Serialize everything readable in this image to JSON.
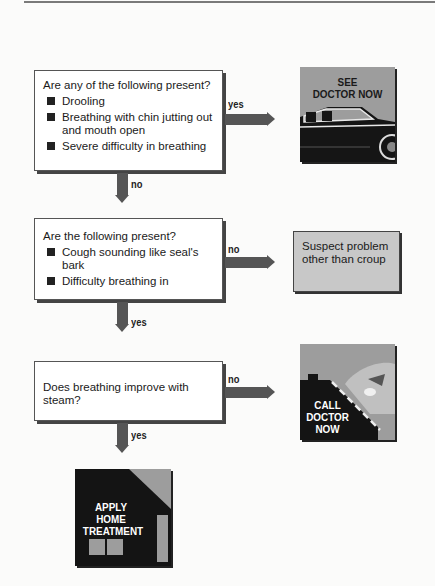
{
  "flowchart": {
    "question1": {
      "text": "Are any of the following present?",
      "items": [
        "Drooling",
        "Breathing with chin jutting out and mouth open",
        "Severe difficulty in breathing"
      ],
      "yes_label": "yes",
      "no_label": "no"
    },
    "outcome_see_doctor": {
      "line1": "SEE",
      "line2": "DOCTOR NOW",
      "icon": "car-icon"
    },
    "question2": {
      "text": "Are the following present?",
      "items": [
        "Cough sounding like seal's bark",
        "Difficulty breathing in"
      ],
      "no_label": "no",
      "yes_label": "yes"
    },
    "outcome_suspect": {
      "line1": "Suspect problem",
      "line2": "other than croup"
    },
    "question3": {
      "text": "Does breathing improve with steam?",
      "no_label": "no",
      "yes_label": "yes"
    },
    "outcome_call_doctor": {
      "line1": "CALL",
      "line2": "DOCTOR",
      "line3": "NOW",
      "icon": "phone-icon"
    },
    "outcome_home": {
      "line1": "APPLY",
      "line2": "HOME",
      "line3": "TREATMENT",
      "icon": "house-icon"
    }
  },
  "colors": {
    "arrow": "#555555",
    "box_border": "#555555",
    "suspect_fill": "#c8c8c8",
    "pic_gray": "#9a9a9a",
    "pic_dark": "#141414"
  }
}
